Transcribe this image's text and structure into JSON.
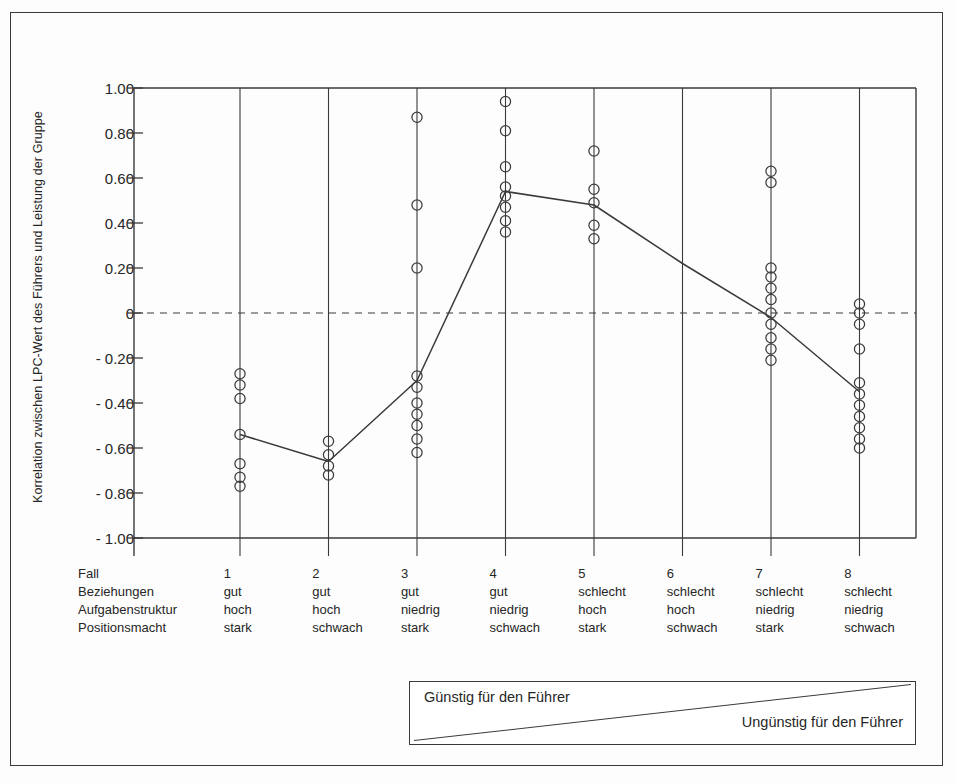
{
  "figure": {
    "y_axis_title": "Korrelation zwischen LPC-Wert des Führers und Leistung der Gruppe",
    "legend": {
      "left_label": "Günstig für den Führer",
      "right_label": "Ungünstig für den Führer"
    },
    "row_headers": [
      "Fall",
      "Beziehungen",
      "Aufgabenstruktur",
      "Positionsmacht"
    ]
  },
  "chart_data": {
    "type": "scatter",
    "title": "",
    "xlabel": "",
    "ylabel": "Korrelation zwischen LPC-Wert des Führers und Leistung der Gruppe",
    "ylim": [
      -1.0,
      1.0
    ],
    "grid": false,
    "legend_position": "below-axes",
    "ytick_labels": [
      "1.00",
      "0.80",
      "0.60",
      "0.40",
      "0.20",
      "0",
      "- 0.20",
      "- 0.40",
      "- 0.60",
      "- 0.80",
      "- 1.00"
    ],
    "ytick_values": [
      1.0,
      0.8,
      0.6,
      0.4,
      0.2,
      0,
      -0.2,
      -0.4,
      -0.6,
      -0.8,
      -1.0
    ],
    "zero_reference_line": 0,
    "categories": [
      "1",
      "2",
      "3",
      "4",
      "5",
      "6",
      "7",
      "8"
    ],
    "category_attributes": {
      "Beziehungen": [
        "gut",
        "gut",
        "gut",
        "gut",
        "schlecht",
        "schlecht",
        "schlecht",
        "schlecht"
      ],
      "Aufgabenstruktur": [
        "hoch",
        "hoch",
        "niedrig",
        "niedrig",
        "hoch",
        "hoch",
        "niedrig",
        "niedrig"
      ],
      "Positionsmacht": [
        "stark",
        "schwach",
        "stark",
        "schwach",
        "stark",
        "schwach",
        "stark",
        "schwach"
      ]
    },
    "points": [
      {
        "case": "1",
        "values": [
          -0.27,
          -0.32,
          -0.38,
          -0.54,
          -0.67,
          -0.73,
          -0.77
        ]
      },
      {
        "case": "2",
        "values": [
          -0.57,
          -0.63,
          -0.68,
          -0.72
        ]
      },
      {
        "case": "3",
        "values": [
          0.87,
          0.48,
          0.2,
          -0.28,
          -0.33,
          -0.4,
          -0.45,
          -0.5,
          -0.56,
          -0.62
        ]
      },
      {
        "case": "4",
        "values": [
          0.94,
          0.81,
          0.65,
          0.56,
          0.52,
          0.47,
          0.41,
          0.36
        ]
      },
      {
        "case": "5",
        "values": [
          0.72,
          0.55,
          0.49,
          0.39,
          0.33
        ]
      },
      {
        "case": "6",
        "values": []
      },
      {
        "case": "7",
        "values": [
          0.63,
          0.58,
          0.2,
          0.16,
          0.11,
          0.06,
          0.0,
          -0.05,
          -0.11,
          -0.16,
          -0.21
        ]
      },
      {
        "case": "8",
        "values": [
          0.04,
          0.0,
          -0.05,
          -0.16,
          -0.31,
          -0.36,
          -0.41,
          -0.46,
          -0.51,
          -0.56,
          -0.6
        ]
      }
    ],
    "series": [
      {
        "name": "Mittelwert der Korrelationen",
        "categories": [
          "1",
          "2",
          "3",
          "4",
          "5",
          "6",
          "7",
          "8"
        ],
        "values": [
          -0.54,
          -0.66,
          -0.3,
          0.54,
          0.48,
          0.22,
          -0.02,
          -0.35
        ]
      }
    ]
  }
}
